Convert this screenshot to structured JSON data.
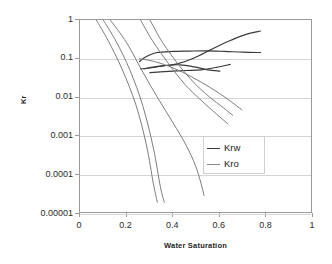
{
  "chart_data": {
    "type": "line",
    "title": "",
    "xlabel": "Water Saturation",
    "ylabel": "Kr",
    "xlim": [
      0,
      1
    ],
    "ylim": [
      1e-05,
      1
    ],
    "yscale": "log",
    "xscale": "linear",
    "grid": true,
    "legend_position": "center-right",
    "xticks": [
      "0",
      "0.2",
      "0.4",
      "0.6",
      "0.8",
      "1"
    ],
    "xtick_values": [
      0,
      0.2,
      0.4,
      0.6,
      0.8,
      1
    ],
    "yticks": [
      "1",
      "0.1",
      "0.01",
      "0.001",
      "0.0001",
      "0.00001"
    ],
    "ytick_values": [
      1,
      0.1,
      0.01,
      0.001,
      0.0001,
      1e-05
    ],
    "legend": [
      {
        "label": "Krw",
        "color": "#3a3a3a"
      },
      {
        "label": "Kro",
        "color": "#8a8a8a"
      }
    ],
    "series": [
      {
        "name": "Krw-1",
        "group": "Krw",
        "color": "#3a3a3a",
        "x": [
          0.255,
          0.285,
          0.33,
          0.4,
          0.47,
          0.545,
          0.62,
          0.7,
          0.775
        ],
        "y": [
          0.085,
          0.115,
          0.145,
          0.155,
          0.158,
          0.16,
          0.155,
          0.148,
          0.145
        ]
      },
      {
        "name": "Krw-2",
        "group": "Krw",
        "color": "#3a3a3a",
        "x": [
          0.26,
          0.3,
          0.355,
          0.42,
          0.49,
          0.56,
          0.635,
          0.71,
          0.775
        ],
        "y": [
          0.055,
          0.058,
          0.065,
          0.075,
          0.105,
          0.17,
          0.28,
          0.42,
          0.52
        ]
      },
      {
        "name": "Krw-3",
        "group": "Krw",
        "color": "#3a3a3a",
        "x": [
          0.3,
          0.345,
          0.4,
          0.455,
          0.52,
          0.585,
          0.645
        ],
        "y": [
          0.044,
          0.046,
          0.048,
          0.05,
          0.052,
          0.06,
          0.072
        ]
      },
      {
        "name": "Krw-4",
        "group": "Krw",
        "color": "#3a3a3a",
        "x": [
          0.275,
          0.32,
          0.375,
          0.43,
          0.49,
          0.55,
          0.6
        ],
        "y": [
          0.055,
          0.062,
          0.068,
          0.07,
          0.062,
          0.052,
          0.048
        ]
      },
      {
        "name": "Kro-1",
        "group": "Kro",
        "color": "#7d7d7d",
        "x": [
          0.07,
          0.12,
          0.18,
          0.24,
          0.285,
          0.315,
          0.332
        ],
        "y": [
          1.0,
          0.3,
          0.055,
          0.0065,
          0.0006,
          6e-05,
          2e-05
        ]
      },
      {
        "name": "Kro-2",
        "group": "Kro",
        "color": "#7d7d7d",
        "x": [
          0.1,
          0.155,
          0.215,
          0.27,
          0.315,
          0.345,
          0.362
        ],
        "y": [
          1.0,
          0.28,
          0.05,
          0.006,
          0.0005,
          5e-05,
          2e-05
        ]
      },
      {
        "name": "Kro-3",
        "group": "Kro",
        "color": "#7d7d7d",
        "x": [
          0.13,
          0.2,
          0.27,
          0.335,
          0.4,
          0.455,
          0.495,
          0.52,
          0.532
        ],
        "y": [
          1.0,
          0.26,
          0.045,
          0.0095,
          0.0022,
          0.0006,
          0.00018,
          6e-05,
          3e-05
        ]
      },
      {
        "name": "Kro-4",
        "group": "Kro",
        "color": "#7d7d7d",
        "x": [
          0.26,
          0.31,
          0.38,
          0.45,
          0.52,
          0.585,
          0.635
        ],
        "y": [
          1.0,
          0.3,
          0.075,
          0.022,
          0.0085,
          0.0038,
          0.0021
        ]
      },
      {
        "name": "Kro-5",
        "group": "Kro",
        "color": "#7d7d7d",
        "x": [
          0.3,
          0.355,
          0.425,
          0.49,
          0.555,
          0.615,
          0.655
        ],
        "y": [
          1.0,
          0.26,
          0.068,
          0.024,
          0.0105,
          0.0055,
          0.0035
        ]
      },
      {
        "name": "Kro-6",
        "group": "Kro",
        "color": "#7d7d7d",
        "x": [
          0.255,
          0.32,
          0.4,
          0.48,
          0.56,
          0.635,
          0.695
        ],
        "y": [
          0.1,
          0.085,
          0.058,
          0.034,
          0.018,
          0.009,
          0.0048
        ]
      }
    ]
  },
  "axes": {
    "x_title": "Water Saturation",
    "y_title": "Kr"
  }
}
